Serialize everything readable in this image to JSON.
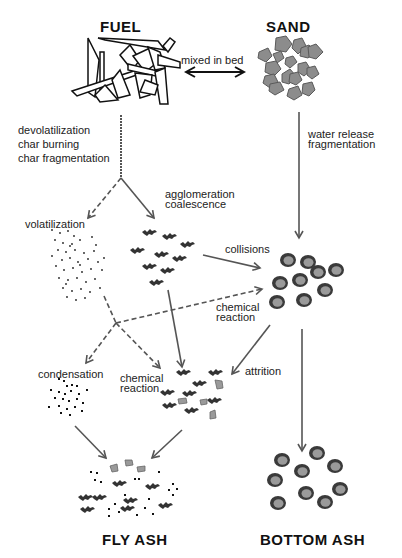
{
  "diagram": {
    "titles": {
      "fuel": "FUEL",
      "sand": "SAND",
      "fly_ash": "FLY ASH",
      "bottom_ash": "BOTTOM ASH"
    },
    "labels": {
      "mixed_in_bed": "mixed in bed",
      "devolatilization": "devolatilization",
      "char_burning": "char burning",
      "char_fragmentation": "char fragmentation",
      "water_release": "water release",
      "fragmentation": "fragmentation",
      "volatilization": "volatilization",
      "agglomeration": "agglomeration",
      "coalescence": "coalescence",
      "collisions": "collisions",
      "chemical_reaction_1": "chemical",
      "chemical_reaction_1b": "reaction",
      "condensation": "condensation",
      "chemical_reaction_2": "chemical",
      "chemical_reaction_2b": "reaction",
      "attrition": "attrition"
    },
    "nodes": [
      {
        "id": "fuel",
        "label": "FUEL",
        "depiction": "fuel-fragments"
      },
      {
        "id": "sand",
        "label": "SAND",
        "depiction": "sand-grains"
      },
      {
        "id": "volatiles",
        "label": "volatilization",
        "depiction": "vapor-dots"
      },
      {
        "id": "agglomerates",
        "label": "agglomeration coalescence",
        "depiction": "ash-agglomerates"
      },
      {
        "id": "coated-sand",
        "label": "",
        "depiction": "coated-sand-particles"
      },
      {
        "id": "condensed",
        "label": "condensation",
        "depiction": "condensed-dots"
      },
      {
        "id": "mixed-ash",
        "label": "chemical reaction",
        "depiction": "mixed-ash-particles"
      },
      {
        "id": "fly-ash",
        "label": "FLY ASH",
        "depiction": "fly-ash-mixture"
      },
      {
        "id": "bottom-ash",
        "label": "BOTTOM ASH",
        "depiction": "bottom-ash-particles"
      }
    ],
    "edges": [
      {
        "from": "fuel",
        "to": "sand",
        "label": "mixed in bed",
        "style": "double-arrow"
      },
      {
        "from": "fuel",
        "to": "split",
        "label": "devolatilization / char burning / char fragmentation",
        "style": "dashed"
      },
      {
        "from": "split",
        "to": "volatiles",
        "style": "dashed"
      },
      {
        "from": "split",
        "to": "agglomerates",
        "style": "solid"
      },
      {
        "from": "sand",
        "to": "coated-sand",
        "label": "water release / fragmentation",
        "style": "solid"
      },
      {
        "from": "agglomerates",
        "to": "coated-sand",
        "label": "collisions",
        "style": "solid"
      },
      {
        "from": "volatiles",
        "to": "coated-sand",
        "label": "chemical reaction",
        "style": "dashed"
      },
      {
        "from": "volatiles",
        "to": "condensed",
        "label": "condensation",
        "style": "dashed"
      },
      {
        "from": "volatiles",
        "to": "mixed-ash",
        "label": "chemical reaction",
        "style": "dashed"
      },
      {
        "from": "agglomerates",
        "to": "mixed-ash",
        "style": "solid"
      },
      {
        "from": "coated-sand",
        "to": "mixed-ash",
        "label": "attrition",
        "style": "solid"
      },
      {
        "from": "condensed",
        "to": "fly-ash",
        "style": "solid"
      },
      {
        "from": "mixed-ash",
        "to": "fly-ash",
        "style": "solid"
      },
      {
        "from": "coated-sand",
        "to": "bottom-ash",
        "style": "solid"
      }
    ],
    "colors": {
      "arrow": "#555555",
      "sand_fill": "#8c8c8c",
      "sand_stroke": "#5a5a5a",
      "ash_core": "#9a9a9a",
      "ash_rim": "#3a3a3a",
      "agglomerate": "#333333",
      "text": "#1a1a1a"
    }
  }
}
